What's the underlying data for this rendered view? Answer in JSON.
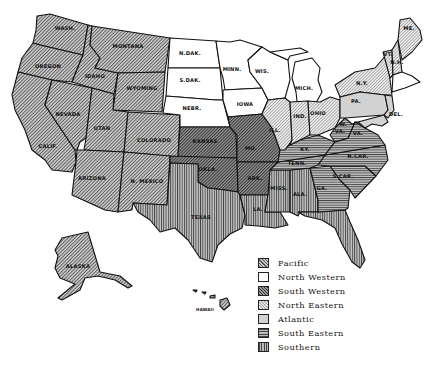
{
  "map": {
    "title": "United States regional map",
    "regions": {
      "pacific": {
        "label": "Pacific",
        "states": [
          "WASH.",
          "OREGON",
          "CALIF.",
          "NEVADA",
          "IDAHO",
          "MONTANA",
          "WYOMING",
          "UTAN",
          "ARIZONA",
          "COLORADO",
          "N. MEXICO",
          "ALASKA",
          "HAWAII"
        ]
      },
      "north_western": {
        "label": "North Western",
        "states": [
          "N.DAK.",
          "S.DAK.",
          "NEBR.",
          "MINN.",
          "IOWA",
          "WIS."
        ]
      },
      "south_western": {
        "label": "South Western",
        "states": [
          "KANSAS",
          "OKLA.",
          "MO.",
          "ARK."
        ]
      },
      "north_eastern": {
        "label": "North Eastern",
        "states": [
          "MICH.",
          "ILL.",
          "IND.",
          "OHIO",
          "N.Y.",
          "ME.",
          "VT.",
          "N.H."
        ]
      },
      "atlantic": {
        "label": "Atlantic",
        "states": [
          "PA.",
          "N.J.",
          "DEL."
        ]
      },
      "south_eastern": {
        "label": "South Eastern",
        "states": [
          "KY.",
          "TENN.",
          "W.VA.",
          "VA.",
          "N.CAR.",
          "S.CAR.",
          "GA."
        ]
      },
      "southern": {
        "label": "Southern",
        "states": [
          "TEXAS",
          "LA.",
          "MISS.",
          "ALA.",
          "FLA."
        ]
      }
    },
    "state_labels": {
      "wash": "WASH.",
      "oregon": "OREGON",
      "calif": "CALIF.",
      "nevada": "NEVADA",
      "idaho": "IDAHO",
      "montana": "MONTANA",
      "wyoming": "WYOMING",
      "utah": "UTAN",
      "arizona": "ARIZONA",
      "colorado": "COLORADO",
      "nmexico": "N. MEXICO",
      "ndak": "N.DAK.",
      "sdak": "S.DAK.",
      "nebr": "NEBR.",
      "kansas": "KANSAS",
      "okla": "OKLA.",
      "texas": "TEXAS",
      "minn": "MINN.",
      "iowa": "IOWA",
      "mo": "MO.",
      "ark": "ARK.",
      "la": "LA.",
      "wis": "WIS.",
      "ill": "ILL.",
      "mich": "MICH.",
      "ind": "IND.",
      "ohio": "OHIO",
      "ky": "KY.",
      "tenn": "TENN.",
      "miss": "MISS.",
      "ala": "ALA.",
      "ga": "GA.",
      "fla": "FLA.",
      "scar": "S.CAR.",
      "ncar": "N.CAR.",
      "va": "VA.",
      "wva_w": "W.",
      "wva_va": "VA.",
      "pa": "PA.",
      "ny": "N.Y.",
      "del": "DEL.",
      "me": "ME.",
      "vt": "VT.",
      "nh": "N.H.",
      "alaska": "ALASKA",
      "hawaii": "HAWAII"
    }
  },
  "legend": {
    "items": [
      {
        "key": "pacific",
        "label": "Pacific"
      },
      {
        "key": "north_western",
        "label": "North Western"
      },
      {
        "key": "south_western",
        "label": "South Western"
      },
      {
        "key": "north_eastern",
        "label": "North Eastern"
      },
      {
        "key": "atlantic",
        "label": "Atlantic"
      },
      {
        "key": "south_eastern",
        "label": "South Eastern"
      },
      {
        "key": "southern",
        "label": "Southern"
      }
    ]
  },
  "colors": {
    "border": "#111111",
    "pacific": "#c8c8c8",
    "north_western": "#ffffff",
    "south_western": "#999999",
    "north_eastern": "#e6e6e6",
    "atlantic": "#d2d2d2",
    "south_eastern": "#bdbdbd",
    "southern": "#bdbdbd"
  }
}
